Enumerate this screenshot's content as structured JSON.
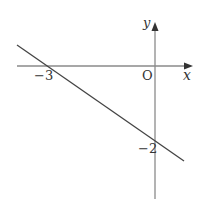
{
  "diagram": {
    "type": "coordinate-plane-line",
    "axes": {
      "x_label": "x",
      "y_label": "y",
      "origin_label": "O",
      "color": "#8a8a8a"
    },
    "line": {
      "x_intercept_label": "−3",
      "y_intercept_label": "−2",
      "x_intercept": -3,
      "y_intercept": -2,
      "color": "#444444"
    }
  }
}
